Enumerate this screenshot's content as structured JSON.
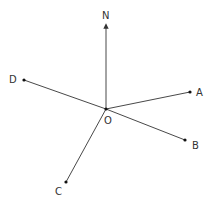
{
  "diagram": {
    "type": "bearing-diagram",
    "origin": {
      "label": "O",
      "x": 106,
      "y": 109,
      "label_x": 107,
      "label_y": 124
    },
    "north": {
      "label": "N",
      "tip_x": 106,
      "tip_y": 24,
      "label_x": 102,
      "label_y": 19
    },
    "points": [
      {
        "id": "A",
        "label": "A",
        "x": 190,
        "y": 92,
        "label_x": 196,
        "label_y": 96
      },
      {
        "id": "B",
        "label": "B",
        "x": 185,
        "y": 140,
        "label_x": 192,
        "label_y": 149
      },
      {
        "id": "C",
        "label": "C",
        "x": 66,
        "y": 182,
        "label_x": 55,
        "label_y": 195
      },
      {
        "id": "D",
        "label": "D",
        "x": 24,
        "y": 80,
        "label_x": 9,
        "label_y": 83
      }
    ],
    "colors": {
      "line": "#333333",
      "dot": "#111111",
      "text": "#333333",
      "background": "#ffffff"
    }
  }
}
